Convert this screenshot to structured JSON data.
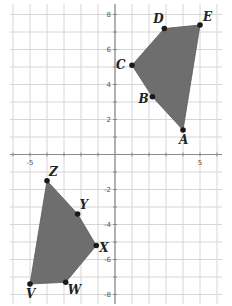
{
  "diagram": {
    "type": "coordinate-plane",
    "grid": {
      "xmin": -6,
      "xmax": 6,
      "ymin": -8,
      "ymax": 8,
      "step": 1
    },
    "axis_tick_labels": {
      "x": [
        {
          "value": -5,
          "label": "-5"
        },
        {
          "value": 5,
          "label": "5"
        }
      ],
      "y": [
        {
          "value": 8,
          "label": "8"
        },
        {
          "value": 6,
          "label": "6"
        },
        {
          "value": 4,
          "label": "4"
        },
        {
          "value": 2,
          "label": "2"
        },
        {
          "value": -2,
          "label": "-2"
        },
        {
          "value": -4,
          "label": "-4"
        },
        {
          "value": -6,
          "label": "-6"
        },
        {
          "value": -8,
          "label": "-8"
        }
      ]
    },
    "colors": {
      "fill": "#6e6e6e",
      "grid": "#d6d6d6",
      "axis": "#8a8a8a",
      "point": "#1a1a1a"
    },
    "polygons": [
      {
        "name": "ABCDE",
        "points": [
          {
            "label": "A",
            "x": 4,
            "y": 1.4,
            "label_dx": -4,
            "label_dy": 14
          },
          {
            "label": "B",
            "x": 2.2,
            "y": 3.3,
            "label_dx": -14,
            "label_dy": 6
          },
          {
            "label": "C",
            "x": 1,
            "y": 5.1,
            "label_dx": -16,
            "label_dy": 4
          },
          {
            "label": "D",
            "x": 2.9,
            "y": 7.2,
            "label_dx": -11,
            "label_dy": -6
          },
          {
            "label": "E",
            "x": 5,
            "y": 7.4,
            "label_dx": 3,
            "label_dy": -4
          }
        ]
      },
      {
        "name": "VWXYZ",
        "points": [
          {
            "label": "Z",
            "x": -4,
            "y": -1.5,
            "label_dx": 2,
            "label_dy": -5
          },
          {
            "label": "Y",
            "x": -2.2,
            "y": -3.4,
            "label_dx": 2,
            "label_dy": -5
          },
          {
            "label": "X",
            "x": -1.1,
            "y": -5.2,
            "label_dx": 3,
            "label_dy": 6
          },
          {
            "label": "W",
            "x": -2.9,
            "y": -7.3,
            "label_dx": 2,
            "label_dy": 12
          },
          {
            "label": "V",
            "x": -5,
            "y": -7.4,
            "label_dx": -4,
            "label_dy": 14
          }
        ]
      }
    ]
  }
}
